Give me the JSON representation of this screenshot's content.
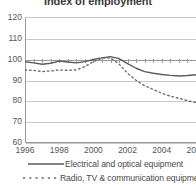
{
  "chart_data": {
    "type": "line",
    "title": "Index of employment",
    "xlabel": "",
    "ylabel": "",
    "xlim": [
      1996,
      2006
    ],
    "ylim": [
      60,
      120
    ],
    "ytick_values": [
      120,
      110,
      100,
      90,
      80,
      70,
      60
    ],
    "ytick_labels": [
      "120",
      "110",
      "100",
      "90",
      "80",
      "70",
      "60"
    ],
    "xtick_values": [
      1996,
      1998,
      2000,
      2002,
      2004,
      2006
    ],
    "xtick_labels": [
      "1996",
      "1998",
      "2000",
      "2002",
      "2004",
      "2006"
    ],
    "grid": true,
    "legend_position": "bottom",
    "x": [
      1996,
      1996.5,
      1997,
      1997.5,
      1998,
      1998.5,
      1999,
      1999.5,
      2000,
      2000.5,
      2001,
      2001.5,
      2002,
      2002.5,
      2003,
      2003.5,
      2004,
      2004.5,
      2005,
      2005.5,
      2006
    ],
    "series": [
      {
        "name": "Electrical and optical equipment",
        "style": "solid",
        "color": "#5a5a5a",
        "values": [
          98.5,
          98.0,
          97.3,
          97.8,
          98.8,
          98.4,
          98.0,
          98.6,
          99.6,
          100.4,
          101.0,
          100.0,
          97.6,
          95.4,
          93.8,
          93.0,
          92.4,
          92.0,
          91.7,
          91.9,
          92.3
        ]
      },
      {
        "name": "Radio, TV & communication equipment",
        "style": "dashed",
        "color": "#6a6a6a",
        "values": [
          94.6,
          94.4,
          93.8,
          94.1,
          94.6,
          94.4,
          94.6,
          96.2,
          98.6,
          100.2,
          100.4,
          97.4,
          93.0,
          89.6,
          87.0,
          85.2,
          83.4,
          82.0,
          81.0,
          79.8,
          78.9
        ]
      }
    ]
  }
}
